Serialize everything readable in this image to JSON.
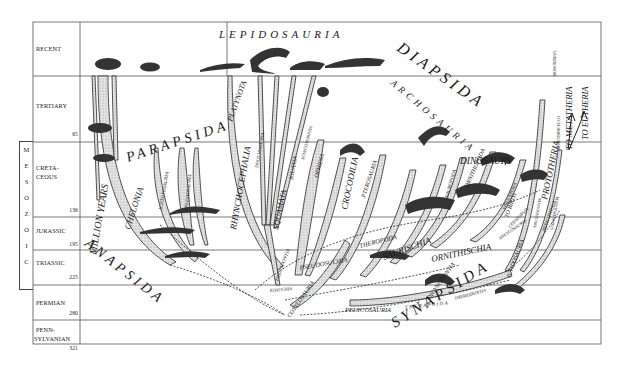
{
  "timescale": {
    "axis_label": "MILLION YEARS",
    "era_group": {
      "label": "MESOZOIC",
      "letters": [
        "M",
        "E",
        "S",
        "O",
        "Z",
        "O",
        "I",
        "C"
      ]
    },
    "periods": [
      {
        "name": "RECENT",
        "ma": ""
      },
      {
        "name": "TERTIARY",
        "ma": "65"
      },
      {
        "name_line1": "CRETA-",
        "name_line2": "CEOUS",
        "ma": "136"
      },
      {
        "name": "JURASSIC",
        "ma": "195"
      },
      {
        "name": "TRIASSIC",
        "ma": "225"
      },
      {
        "name": "PERMIAN",
        "ma": "280"
      },
      {
        "name_line1": "PENN-",
        "name_line2": "SYLVANIAN",
        "ma": "321"
      }
    ]
  },
  "major_groups": {
    "anapsida": "ANAPSIDA",
    "parapsida": "PARAPSIDA",
    "diapsida": "DIAPSIDA",
    "synapsida": "SYNAPSIDA",
    "lepidosauria": "LEPIDOSAURIA",
    "archosauria": "ARCHOSAURIA",
    "dinosaurs": "DINOSAURS"
  },
  "lineages": {
    "chelonia": "CHELONIA",
    "ichthyosauria": "ICHTHYOSAURIA",
    "plesiosauria": "PLESIOSAURIA",
    "rhynchocephalia": "RHYNCHOCEPHALIA",
    "platynota": "PLATYNOTA",
    "dolichosauria": "DOLICHOSAURIA",
    "squamata": "SQUAMATA",
    "iguania": "IGUANIA",
    "scincomorpha": "SCINCOMORPHA",
    "ophidia": "OPHIDIA",
    "crocodilia": "CROCODILIA",
    "pterosauria": "PTEROSAURIA",
    "sauropoda": "SAUROPODA",
    "ornithopoda": "ORNITHOPODA",
    "stegosauria": "STEGOSAURIA",
    "ceratopsia": "CERATOPSIA",
    "ankylosauria": "ANKYLOSAURIA",
    "theropoda": "THEROPODA",
    "saurischia": "SAURISCHIA",
    "ornithischia": "ORNITHISCHIA",
    "pseudosuchia": "PSEUDOSUCHIA",
    "thecodontia": "THECODONTIA",
    "eosuchia": "EOSUCHIA",
    "cotylosauria": "COTYLOSAURIA",
    "pelycosauria": "PELYCOSAURIA",
    "therapsida": "THERAPSIDA",
    "theriodontia": "THERIODONTIA",
    "dicynodontia": "DICYNODONTIA",
    "ictidosauria": "ICTIDOSAURIA",
    "to_birds": "TO BIRDS",
    "prototheria": "PROTOTHERIA",
    "monotremata": "MONOTREMATA",
    "multituberculata": "MULTITUBERCULATA",
    "triconodonta": "TRICONODONTA",
    "symmetrodonta": "SYMMETRODONTA",
    "pantotheria": "PANTOTHERIA",
    "to_metatheria": "TO METATHERIA",
    "to_eutheria": "TO EUTHERIA"
  },
  "colors": {
    "line": "#2a2a2a",
    "fill": "#d9d9d9",
    "grid": "#555555",
    "background": "#ffffff"
  }
}
